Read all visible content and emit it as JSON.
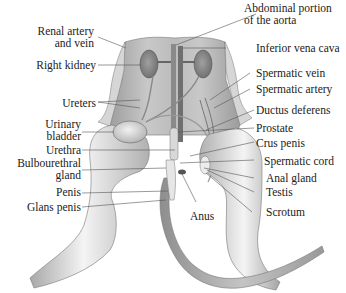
{
  "figure": {
    "labels_left": [
      {
        "id": "renal-artery-vein",
        "lines": [
          "Renal artery",
          "and vein"
        ]
      },
      {
        "id": "right-kidney",
        "lines": [
          "Right kidney"
        ]
      },
      {
        "id": "ureters",
        "lines": [
          "Ureters"
        ]
      },
      {
        "id": "urinary-bladder",
        "lines": [
          "Urinary",
          "bladder"
        ]
      },
      {
        "id": "urethra",
        "lines": [
          "Urethra"
        ]
      },
      {
        "id": "bulbourethral-gland",
        "lines": [
          "Bulbourethral",
          "gland"
        ]
      },
      {
        "id": "penis",
        "lines": [
          "Penis"
        ]
      },
      {
        "id": "glans-penis",
        "lines": [
          "Glans penis"
        ]
      }
    ],
    "labels_right": [
      {
        "id": "abdominal-aorta",
        "lines": [
          "Abdominal portion",
          "of the aorta"
        ]
      },
      {
        "id": "inferior-vena-cava",
        "lines": [
          "Inferior vena cava"
        ]
      },
      {
        "id": "spermatic-vein",
        "lines": [
          "Spermatic vein"
        ]
      },
      {
        "id": "spermatic-artery",
        "lines": [
          "Spermatic artery"
        ]
      },
      {
        "id": "ductus-deferens",
        "lines": [
          "Ductus deferens"
        ]
      },
      {
        "id": "prostate",
        "lines": [
          "Prostate"
        ]
      },
      {
        "id": "crus-penis",
        "lines": [
          "Crus penis"
        ]
      },
      {
        "id": "spermatic-cord",
        "lines": [
          "Spermatic cord"
        ]
      },
      {
        "id": "anal-gland",
        "lines": [
          "Anal gland"
        ]
      },
      {
        "id": "testis",
        "lines": [
          "Testis"
        ]
      },
      {
        "id": "scrotum",
        "lines": [
          "Scrotum"
        ]
      }
    ],
    "labels_bottom": [
      {
        "id": "anus",
        "lines": [
          "Anus"
        ]
      }
    ],
    "colors": {
      "background": "#ffffff",
      "tissue_light": "#e6e6e6",
      "tissue_mid": "#bdbdbd",
      "tissue_dark": "#8a8a8a",
      "organ": "#9a9a9a",
      "leader_line": "#555555",
      "text": "#222222"
    }
  }
}
